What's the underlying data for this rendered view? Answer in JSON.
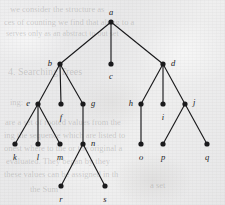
{
  "figure": {
    "kind": "rooted-tree-diagram",
    "background_color": "#ececed",
    "ink_color": "#1a1a1c",
    "node_radius": 2.6,
    "edge_width": 1.15,
    "width": 225,
    "height": 205
  },
  "ghost_text": [
    {
      "text": "we consider the structure as",
      "x": 10,
      "y": 4,
      "size": 8.5,
      "rotate": 0
    },
    {
      "text": "ces of counting we find that along to a",
      "x": 4,
      "y": 17,
      "size": 8.5,
      "rotate": 0
    },
    {
      "text": "serves only as an abstract to out set",
      "x": 6,
      "y": 29,
      "size": 8,
      "rotate": 0
    },
    {
      "text": "4. Searching Trees",
      "x": 8,
      "y": 66,
      "size": 10,
      "rotate": 0
    },
    {
      "text": "ing:",
      "x": 10,
      "y": 97,
      "size": 8.5,
      "rotate": 0
    },
    {
      "text": "are a set of rooted values from the",
      "x": 5,
      "y": 117,
      "size": 8.5,
      "rotate": 0
    },
    {
      "text": "ing the sequence which are listed to",
      "x": 4,
      "y": 130,
      "size": 8.5,
      "rotate": 0
    },
    {
      "text": "onest where to the or the original a",
      "x": 4,
      "y": 143,
      "size": 8.5,
      "rotate": 0
    },
    {
      "text": "evaluated. They began by they",
      "x": 6,
      "y": 156,
      "size": 8.5,
      "rotate": 0
    },
    {
      "text": "these values can be assigned in th",
      "x": 4,
      "y": 169,
      "size": 8.5,
      "rotate": 0
    },
    {
      "text": "the Sum",
      "x": 30,
      "y": 184,
      "size": 8.5,
      "rotate": 0
    },
    {
      "text": "a set",
      "x": 150,
      "y": 180,
      "size": 8.5,
      "rotate": 0
    }
  ],
  "tree": {
    "root": "a",
    "nodes": [
      {
        "id": "a",
        "label": "a",
        "x": 111,
        "y": 22,
        "label_dx": 0,
        "label_dy": -10,
        "label_anchor": "middle"
      },
      {
        "id": "b",
        "label": "b",
        "x": 60,
        "y": 64,
        "label_dx": -8,
        "label_dy": -1,
        "label_anchor": "end"
      },
      {
        "id": "c",
        "label": "c",
        "x": 111,
        "y": 64,
        "label_dx": 0,
        "label_dy": 12,
        "label_anchor": "middle"
      },
      {
        "id": "d",
        "label": "d",
        "x": 163,
        "y": 64,
        "label_dx": 8,
        "label_dy": -1,
        "label_anchor": "start"
      },
      {
        "id": "e",
        "label": "e",
        "x": 38,
        "y": 104,
        "label_dx": -8,
        "label_dy": -1,
        "label_anchor": "end"
      },
      {
        "id": "f",
        "label": "f",
        "x": 61,
        "y": 104,
        "label_dx": 0,
        "label_dy": 13,
        "label_anchor": "middle"
      },
      {
        "id": "g",
        "label": "g",
        "x": 83,
        "y": 104,
        "label_dx": 8,
        "label_dy": -1,
        "label_anchor": "start"
      },
      {
        "id": "h",
        "label": "h",
        "x": 141,
        "y": 104,
        "label_dx": -8,
        "label_dy": -1,
        "label_anchor": "end"
      },
      {
        "id": "i",
        "label": "i",
        "x": 163,
        "y": 104,
        "label_dx": 0,
        "label_dy": 13,
        "label_anchor": "middle"
      },
      {
        "id": "j",
        "label": "j",
        "x": 185,
        "y": 104,
        "label_dx": 8,
        "label_dy": -2,
        "label_anchor": "start"
      },
      {
        "id": "k",
        "label": "k",
        "x": 15,
        "y": 144,
        "label_dx": 0,
        "label_dy": 13,
        "label_anchor": "middle"
      },
      {
        "id": "l",
        "label": "l",
        "x": 38,
        "y": 144,
        "label_dx": 0,
        "label_dy": 13,
        "label_anchor": "middle"
      },
      {
        "id": "m",
        "label": "m",
        "x": 60,
        "y": 144,
        "label_dx": 0,
        "label_dy": 13,
        "label_anchor": "middle"
      },
      {
        "id": "n",
        "label": "n",
        "x": 83,
        "y": 144,
        "label_dx": 8,
        "label_dy": -1,
        "label_anchor": "start"
      },
      {
        "id": "o",
        "label": "o",
        "x": 141,
        "y": 144,
        "label_dx": 0,
        "label_dy": 13,
        "label_anchor": "middle"
      },
      {
        "id": "p",
        "label": "p",
        "x": 163,
        "y": 144,
        "label_dx": 0,
        "label_dy": 13,
        "label_anchor": "middle"
      },
      {
        "id": "q",
        "label": "q",
        "x": 207,
        "y": 144,
        "label_dx": 0,
        "label_dy": 13,
        "label_anchor": "middle"
      },
      {
        "id": "r",
        "label": "r",
        "x": 61,
        "y": 186,
        "label_dx": 0,
        "label_dy": 13,
        "label_anchor": "middle"
      },
      {
        "id": "s",
        "label": "s",
        "x": 105,
        "y": 186,
        "label_dx": 0,
        "label_dy": 13,
        "label_anchor": "middle"
      }
    ],
    "edges": [
      {
        "from": "a",
        "to": "b"
      },
      {
        "from": "a",
        "to": "c"
      },
      {
        "from": "a",
        "to": "d"
      },
      {
        "from": "b",
        "to": "e"
      },
      {
        "from": "b",
        "to": "f"
      },
      {
        "from": "b",
        "to": "g"
      },
      {
        "from": "d",
        "to": "h"
      },
      {
        "from": "d",
        "to": "i"
      },
      {
        "from": "d",
        "to": "j"
      },
      {
        "from": "e",
        "to": "k"
      },
      {
        "from": "e",
        "to": "l"
      },
      {
        "from": "e",
        "to": "m"
      },
      {
        "from": "g",
        "to": "n"
      },
      {
        "from": "h",
        "to": "o"
      },
      {
        "from": "j",
        "to": "p"
      },
      {
        "from": "j",
        "to": "q"
      },
      {
        "from": "n",
        "to": "r"
      },
      {
        "from": "n",
        "to": "s"
      }
    ]
  }
}
